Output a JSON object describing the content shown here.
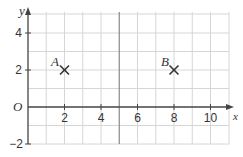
{
  "diagram": {
    "type": "coordinate-grid",
    "x_axis": {
      "label": "x",
      "ticks": [
        "2",
        "4",
        "6",
        "8",
        "10"
      ],
      "range": [
        0,
        10.5
      ]
    },
    "y_axis": {
      "label": "y",
      "ticks": [
        "4",
        "2",
        "-2"
      ],
      "range": [
        -2,
        4.5
      ]
    },
    "origin_label": "O",
    "points": [
      {
        "label": "A",
        "x": 2,
        "y": 2,
        "marker": "cross"
      },
      {
        "label": "B",
        "x": 8,
        "y": 2,
        "marker": "cross"
      }
    ],
    "highlight_line": {
      "x": 5
    }
  },
  "labels": {
    "x_axis": "x",
    "y_axis": "y",
    "origin": "O",
    "tick_x_2": "2",
    "tick_x_4": "4",
    "tick_x_6": "6",
    "tick_x_8": "8",
    "tick_x_10": "10",
    "tick_y_4": "4",
    "tick_y_2": "2",
    "tick_y_neg2": "−2",
    "point_a": "A",
    "point_b": "B"
  },
  "colors": {
    "grid": "#d6d6d6",
    "axis": "#444444",
    "highlight": "#888888",
    "marker": "#333333"
  }
}
